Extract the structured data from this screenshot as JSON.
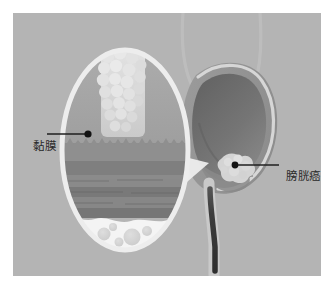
{
  "figure": {
    "type": "medical-illustration",
    "background_color": "#ffffff",
    "panel_color": "#b4b4b4"
  },
  "labels": {
    "mucosa": {
      "text": "黏膜",
      "meaning": "mucosa",
      "leader_dot": {
        "x": 88,
        "y": 134
      },
      "leader_line": {
        "x1": 47,
        "y1": 134,
        "x2": 86,
        "y2": 134
      }
    },
    "bladder_cancer": {
      "text": "膀胱癌",
      "meaning": "bladder cancer",
      "leader_dot": {
        "x": 224,
        "y": 164
      },
      "leader_line": {
        "x1": 226,
        "y1": 164,
        "x2": 270,
        "y2": 164
      }
    }
  },
  "anatomy": {
    "bladder": {
      "name": "bladder",
      "wall_color": "#9a9a9a",
      "rim_color": "#cfcfcf",
      "lumen_color": "#6e6e6e"
    },
    "ureters": {
      "name": "ureters",
      "count": 2,
      "color": "#c4c4c4"
    },
    "urethra": {
      "name": "urethra",
      "color": "#3a3a3a"
    },
    "tumor": {
      "name": "tumor-mass",
      "color": "#d2d2d2"
    }
  },
  "inset": {
    "name": "magnified-wall-cross-section",
    "shape": "ellipse",
    "center": {
      "x": 125,
      "y": 150
    },
    "radius_x": 63,
    "radius_y": 100,
    "border_color": "#e8e8e8",
    "layers": [
      {
        "name": "lumen",
        "color": "#a6a6a6"
      },
      {
        "name": "papillary-tumor",
        "color": "#dcdcdc"
      },
      {
        "name": "mucosa",
        "color": "#8f8f8f"
      },
      {
        "name": "submucosa",
        "color": "#7e7e7e"
      },
      {
        "name": "muscularis",
        "color": "#888888"
      },
      {
        "name": "adipose-tissue",
        "color": "#f2f2f2"
      }
    ]
  }
}
